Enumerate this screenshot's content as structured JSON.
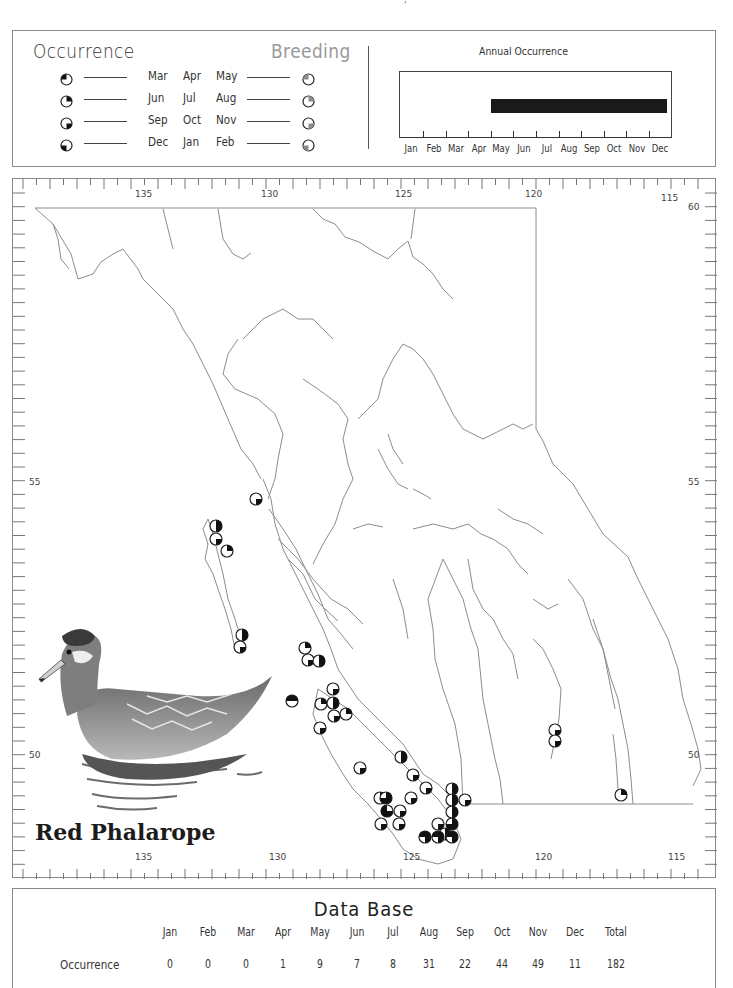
{
  "page_mark": "'",
  "legend": {
    "occurrence_title": "Occurrence",
    "breeding_title": "Breeding",
    "rows": [
      {
        "months": [
          "Mar",
          "Apr",
          "May"
        ],
        "quadrant": "top-left",
        "symbol_icon": "pie-quarter-top-left-icon"
      },
      {
        "months": [
          "Jun",
          "Jul",
          "Aug"
        ],
        "quadrant": "top-right",
        "symbol_icon": "pie-quarter-top-right-icon"
      },
      {
        "months": [
          "Sep",
          "Oct",
          "Nov"
        ],
        "quadrant": "bottom-right",
        "symbol_icon": "pie-quarter-bottom-right-icon"
      },
      {
        "months": [
          "Dec",
          "Jan",
          "Feb"
        ],
        "quadrant": "bottom-left",
        "symbol_icon": "pie-quarter-bottom-left-icon"
      }
    ],
    "occurrence_color": "#111111",
    "breeding_color": "#8c8c8c"
  },
  "annual": {
    "title": "Annual Occurrence",
    "months": [
      "Jan",
      "Feb",
      "Mar",
      "Apr",
      "May",
      "Jun",
      "Jul",
      "Aug",
      "Sep",
      "Oct",
      "Nov",
      "Dec"
    ],
    "bar_start_month_index": 4.0,
    "bar_end_month_index": 11.8,
    "bar_color": "#1a1a1a"
  },
  "map": {
    "top_lon_labels": [
      "135",
      "130",
      "125",
      "120",
      "115"
    ],
    "bottom_lon_labels": [
      "135",
      "130",
      "125",
      "120",
      "115"
    ],
    "left_lat_labels": [
      "55",
      "50"
    ],
    "right_lat_labels": [
      "60",
      "55",
      "50"
    ],
    "species_name": "Red Phalarope",
    "illustration": "red-phalarope-illustration",
    "markers": [
      {
        "x": 243,
        "y": 320,
        "q": [
          3
        ]
      },
      {
        "x": 203,
        "y": 347,
        "q": [
          2,
          3
        ]
      },
      {
        "x": 203,
        "y": 360,
        "q": [
          3
        ]
      },
      {
        "x": 214,
        "y": 372,
        "q": [
          2
        ]
      },
      {
        "x": 229,
        "y": 456,
        "q": [
          2,
          3
        ]
      },
      {
        "x": 227,
        "y": 468,
        "q": [
          3
        ]
      },
      {
        "x": 292,
        "y": 469,
        "q": [
          2
        ]
      },
      {
        "x": 295,
        "y": 481,
        "q": [
          3
        ]
      },
      {
        "x": 306,
        "y": 482,
        "q": [
          2,
          3
        ]
      },
      {
        "x": 279,
        "y": 522,
        "q": [
          1,
          2
        ]
      },
      {
        "x": 320,
        "y": 510,
        "q": [
          3
        ]
      },
      {
        "x": 308,
        "y": 525,
        "q": [
          2
        ]
      },
      {
        "x": 320,
        "y": 524,
        "q": [
          2,
          3
        ]
      },
      {
        "x": 333,
        "y": 535,
        "q": [
          2
        ]
      },
      {
        "x": 321,
        "y": 537,
        "q": [
          3
        ]
      },
      {
        "x": 307,
        "y": 549,
        "q": [
          3
        ]
      },
      {
        "x": 388,
        "y": 578,
        "q": [
          2,
          3
        ]
      },
      {
        "x": 347,
        "y": 589,
        "q": [
          3
        ]
      },
      {
        "x": 400,
        "y": 596,
        "q": [
          3
        ]
      },
      {
        "x": 413,
        "y": 609,
        "q": [
          3
        ]
      },
      {
        "x": 367,
        "y": 619,
        "q": [
          2
        ]
      },
      {
        "x": 373,
        "y": 619,
        "q": [
          2,
          3,
          4
        ]
      },
      {
        "x": 374,
        "y": 632,
        "q": [
          1,
          3,
          4
        ]
      },
      {
        "x": 387,
        "y": 632,
        "q": [
          3
        ]
      },
      {
        "x": 368,
        "y": 645,
        "q": [
          3
        ]
      },
      {
        "x": 386,
        "y": 645,
        "q": [
          3
        ]
      },
      {
        "x": 398,
        "y": 619,
        "q": [
          3
        ]
      },
      {
        "x": 439,
        "y": 610,
        "q": [
          2,
          3
        ]
      },
      {
        "x": 439,
        "y": 621,
        "q": [
          2,
          3
        ]
      },
      {
        "x": 452,
        "y": 621,
        "q": [
          3
        ]
      },
      {
        "x": 439,
        "y": 633,
        "q": [
          2,
          3
        ]
      },
      {
        "x": 439,
        "y": 645,
        "q": [
          2,
          3,
          4
        ]
      },
      {
        "x": 425,
        "y": 645,
        "q": [
          3
        ]
      },
      {
        "x": 432,
        "y": 655,
        "q": [
          2,
          3
        ]
      },
      {
        "x": 412,
        "y": 658,
        "q": [
          1,
          2,
          3
        ]
      },
      {
        "x": 425,
        "y": 658,
        "q": [
          1,
          2,
          3
        ]
      },
      {
        "x": 439,
        "y": 658,
        "q": [
          1,
          2,
          3
        ]
      },
      {
        "x": 542,
        "y": 551,
        "q": [
          3
        ]
      },
      {
        "x": 542,
        "y": 562,
        "q": [
          3
        ]
      },
      {
        "x": 608,
        "y": 616,
        "q": [
          2
        ]
      }
    ]
  },
  "database": {
    "title": "Data Base",
    "columns": [
      "Jan",
      "Feb",
      "Mar",
      "Apr",
      "May",
      "Jun",
      "Jul",
      "Aug",
      "Sep",
      "Oct",
      "Nov",
      "Dec",
      "Total"
    ],
    "rows": [
      {
        "label": "Occurrence",
        "values": [
          "0",
          "0",
          "0",
          "1",
          "9",
          "7",
          "8",
          "31",
          "22",
          "44",
          "49",
          "11",
          "182"
        ]
      }
    ]
  },
  "chart_data": {
    "type": "bar",
    "title": "Annual Occurrence",
    "categories": [
      "Jan",
      "Feb",
      "Mar",
      "Apr",
      "May",
      "Jun",
      "Jul",
      "Aug",
      "Sep",
      "Oct",
      "Nov",
      "Dec"
    ],
    "values": [
      0,
      0,
      0,
      1,
      9,
      7,
      8,
      31,
      22,
      44,
      49,
      11
    ],
    "total": 182,
    "xlabel": "",
    "ylabel": "Occurrence"
  }
}
